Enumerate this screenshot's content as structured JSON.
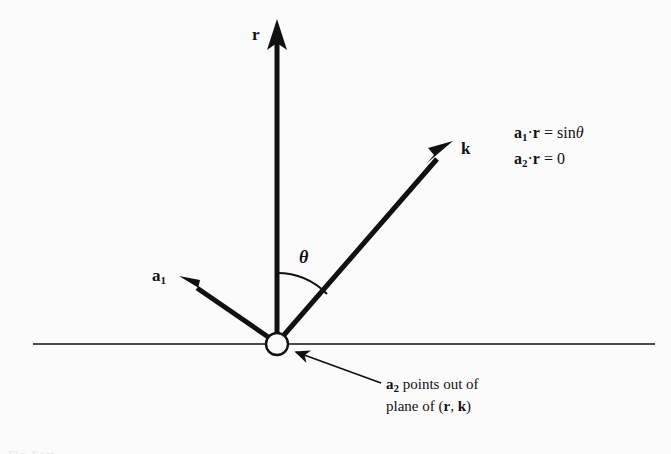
{
  "figure": {
    "background_color": "#fbfbfb",
    "ink_color": "#111111",
    "vectors": {
      "r": {
        "label": "r",
        "description": "vertical-up-vector"
      },
      "k": {
        "label": "k",
        "description": "diagonal-up-right-vector"
      },
      "a1": {
        "label": "a",
        "subscript": "1",
        "description": "diagonal-up-left-vector"
      }
    },
    "angle": {
      "label": "θ",
      "description": "angle-between-r-and-k"
    },
    "origin": {
      "label": "",
      "description": "open-circle-at-origin"
    },
    "equations": [
      {
        "lhs_vector": "a",
        "lhs_subscript": "1",
        "operator": "·",
        "rhs_vector": "r",
        "equals": "=",
        "result": "sin",
        "result_symbol": "θ",
        "full_text": "a₁·r = sin θ"
      },
      {
        "lhs_vector": "a",
        "lhs_subscript": "2",
        "operator": "·",
        "rhs_vector": "r",
        "equals": "=",
        "result": "0",
        "result_symbol": "",
        "full_text": "a₂·r = 0"
      }
    ],
    "annotation": {
      "line1_vector": "a",
      "line1_subscript": "2",
      "line1_text": "points out of",
      "line2_prefix": "plane of (",
      "line2_vec1": "r",
      "line2_sep": ", ",
      "line2_vec2": "k",
      "line2_suffix": ")",
      "full_text": "a₂ points out of plane of (r, k)"
    },
    "cropped_caption": "Fig. Sect."
  }
}
